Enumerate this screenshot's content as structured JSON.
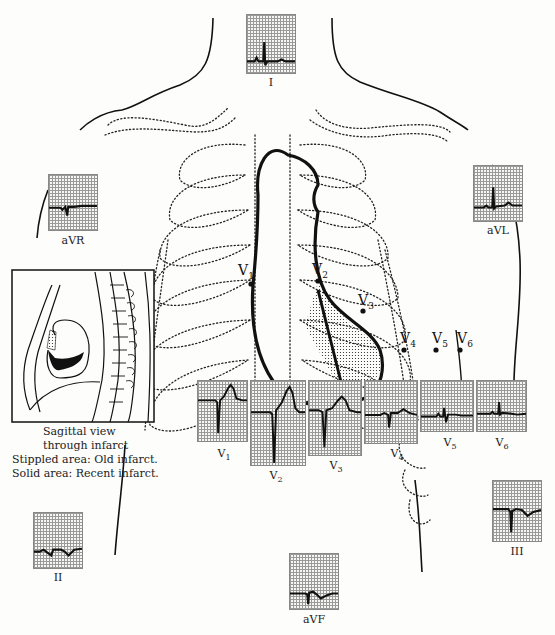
{
  "figure": {
    "leads": {
      "I": {
        "label": "I"
      },
      "aVR": {
        "label": "aVR"
      },
      "aVL": {
        "label": "aVL"
      },
      "II": {
        "label": "II"
      },
      "III": {
        "label": "III"
      },
      "aVF": {
        "label": "aVF"
      },
      "V1": {
        "label": "V",
        "sub": "1"
      },
      "V2": {
        "label": "V",
        "sub": "2"
      },
      "V3": {
        "label": "V",
        "sub": "3"
      },
      "V4": {
        "label": "V",
        "sub": "4"
      },
      "V5": {
        "label": "V",
        "sub": "5"
      },
      "V6": {
        "label": "V",
        "sub": "6"
      }
    },
    "electrodes": [
      {
        "name": "V",
        "sub": "1"
      },
      {
        "name": "V",
        "sub": "2"
      },
      {
        "name": "V",
        "sub": "3"
      },
      {
        "name": "V",
        "sub": "4"
      },
      {
        "name": "V",
        "sub": "5"
      },
      {
        "name": "V",
        "sub": "6"
      }
    ],
    "inset": {
      "caption_line1": "Sagittal view",
      "caption_line2": "through infarct"
    },
    "legend": {
      "stippled": "Stippled area:  Old infarct.",
      "solid": "Solid area:  Recent infarct."
    },
    "colors": {
      "ink": "#111111",
      "grid": "#9a9a9a",
      "paper": "#fdfdfb"
    }
  }
}
